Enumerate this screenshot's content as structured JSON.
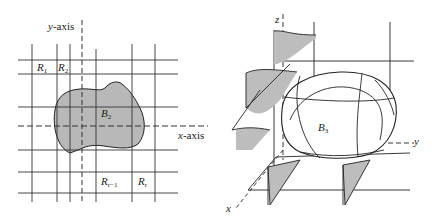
{
  "figures": [
    {
      "id": "left",
      "title": "Region B2 in the xy-plane partitioned by grid rectangles",
      "axes": {
        "y_label": "y",
        "y_suffix": "-axis",
        "x_label": "x",
        "x_suffix": "-axis"
      },
      "region_label": {
        "letter": "B",
        "sub": "2"
      },
      "cells": [
        {
          "letter": "R",
          "sub": "1"
        },
        {
          "letter": "R",
          "sub": "2"
        },
        {
          "letter": "R",
          "sub": "r−1"
        },
        {
          "letter": "R",
          "sub": "r"
        }
      ],
      "colors": {
        "lines": "#333333",
        "fill": "#b8b8b8"
      }
    },
    {
      "id": "right",
      "title": "Solid B3 in xyz-space with cross-sections",
      "axes": {
        "z_label": "z",
        "y_label": "y",
        "x_label": "x"
      },
      "region_label": {
        "letter": "B",
        "sub": "3"
      },
      "colors": {
        "lines": "#222222",
        "fill": "#bdbdbd"
      }
    }
  ]
}
